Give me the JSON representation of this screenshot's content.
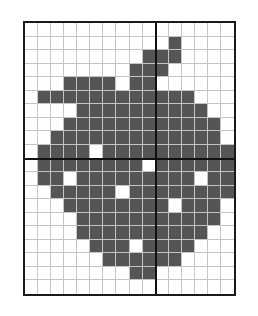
{
  "figure": {
    "cols": 16,
    "rows": 20,
    "axis_col_after": 10,
    "axis_row_after": 10,
    "colors": {
      "filled": "#555555",
      "empty": "#ffffff",
      "gridline": "#c4c4c4",
      "axis": "#111111",
      "border": "#1a1a1a"
    },
    "filled_cells_by_row": [
      [],
      [
        11
      ],
      [
        9,
        10,
        11
      ],
      [
        8,
        9,
        10
      ],
      [
        3,
        4,
        5,
        6,
        8,
        9
      ],
      [
        1,
        2,
        3,
        4,
        5,
        6,
        7,
        8,
        9,
        10,
        11,
        12
      ],
      [
        4,
        5,
        6,
        7,
        8,
        9,
        10,
        11,
        12,
        13
      ],
      [
        3,
        4,
        5,
        6,
        7,
        8,
        9,
        10,
        11,
        12,
        13,
        14
      ],
      [
        2,
        3,
        4,
        5,
        6,
        7,
        8,
        9,
        10,
        11,
        12,
        13,
        14
      ],
      [
        1,
        2,
        3,
        4,
        6,
        7,
        8,
        9,
        10,
        11,
        12,
        13,
        14,
        15
      ],
      [
        1,
        2,
        3,
        4,
        5,
        6,
        7,
        8,
        10,
        11,
        12,
        13,
        14,
        15
      ],
      [
        1,
        2,
        4,
        5,
        6,
        7,
        8,
        9,
        10,
        11,
        12,
        14,
        15
      ],
      [
        2,
        3,
        4,
        5,
        6,
        8,
        9,
        10,
        11,
        12,
        13,
        14,
        15
      ],
      [
        3,
        4,
        5,
        6,
        7,
        8,
        9,
        10,
        12,
        13,
        14
      ],
      [
        4,
        5,
        6,
        7,
        8,
        9,
        10,
        11,
        12,
        13,
        14
      ],
      [
        4,
        5,
        6,
        7,
        8,
        9,
        10,
        11,
        12,
        13
      ],
      [
        5,
        6,
        7,
        9,
        10,
        11,
        12
      ],
      [
        6,
        7,
        8,
        9,
        10,
        11
      ],
      [
        8,
        9
      ],
      []
    ]
  }
}
